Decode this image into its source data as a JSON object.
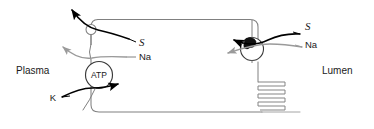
{
  "diagram": {
    "type": "cell-membrane-transport",
    "compartments": {
      "left_label": "Plasma",
      "right_label": "Lumen"
    },
    "cell": {
      "shape": "rounded-rectangle",
      "outline_color": "#808080",
      "fill_color": "#ffffff"
    },
    "transporters": [
      {
        "id": "basolateral-symporter",
        "glyph": "open-circle",
        "label": "",
        "side": "left"
      },
      {
        "id": "sodium-potassium-atpase",
        "glyph": "circle-with-text",
        "label": "ATP",
        "side": "left"
      },
      {
        "id": "apical-symporter",
        "glyph": "circle-with-filled-blob",
        "label": "",
        "side": "right"
      },
      {
        "id": "membrane-serpentine",
        "glyph": "serpentine-coil",
        "label": "",
        "side": "right",
        "loops": 5
      }
    ],
    "solute_labels": {
      "left_s": "S",
      "left_na": "Na",
      "left_k": "K",
      "right_s": "S",
      "right_na": "Na"
    },
    "colors": {
      "black_arrow": "#000000",
      "gray_arrow": "#9a9a9a",
      "membrane": "#808080",
      "text": "#1a1a1a"
    },
    "arrows": [
      {
        "id": "left-s-out",
        "color": "black",
        "direction": "out-of-cell-up-left",
        "solute": "S"
      },
      {
        "id": "left-na-out",
        "color": "gray",
        "direction": "out-of-cell-up-left",
        "solute": "Na"
      },
      {
        "id": "left-k-in",
        "color": "black",
        "direction": "into-cell-right",
        "solute": "K"
      },
      {
        "id": "right-s-in",
        "color": "black",
        "direction": "into-cell-up-left",
        "solute": "S"
      },
      {
        "id": "right-na-in",
        "color": "gray",
        "direction": "into-cell-down-left",
        "solute": "Na"
      }
    ]
  }
}
